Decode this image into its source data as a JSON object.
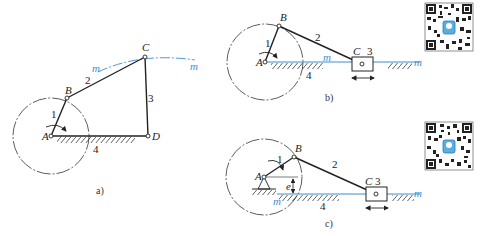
{
  "figure_a": {
    "caption": "a)",
    "points": {
      "A": "A",
      "B": "B",
      "C": "C",
      "D": "D"
    },
    "links": {
      "l1": "1",
      "l2": "2",
      "l3": "3",
      "l4": "4"
    },
    "trace": {
      "m_left": "m",
      "m_right": "m"
    }
  },
  "figure_b": {
    "caption": "b)",
    "points": {
      "A": "A",
      "B": "B",
      "C": "C"
    },
    "links": {
      "l1": "1",
      "l2": "2",
      "l3": "3",
      "l4": "4"
    },
    "trace": {
      "m_center": "m",
      "m_right": "m"
    }
  },
  "figure_c": {
    "caption": "c)",
    "points": {
      "A": "A",
      "B": "B",
      "C": "C"
    },
    "links": {
      "l1": "1",
      "l2": "2",
      "l3": "3",
      "l4": "4"
    },
    "offset": "e",
    "trace": {
      "m_left": "m",
      "m_right": "m"
    }
  },
  "colors": {
    "line": "#222222",
    "trace": "#3a8fd0"
  }
}
